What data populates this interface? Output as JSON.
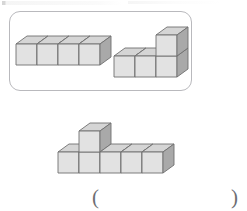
{
  "page": {
    "background_color": "#ffffff",
    "artifact_note": "faint cut-off ruled marks along the top edge"
  },
  "figure_panel": {
    "border_color": "#b9b9bd",
    "corner_radius": 11,
    "label": "reference solids panel"
  },
  "cube_style": {
    "top_face_color": "#d5d5d5",
    "left_face_color": "#e2e2e2",
    "right_face_color": "#a9a9a9",
    "edge_color": "#6f6f6f",
    "cell": 21,
    "depth_x": 11,
    "depth_y": 8
  },
  "solids": [
    {
      "id": "stack-a",
      "name": "four-cube-row",
      "cube_count": 4,
      "description": "a straight row of four cubes",
      "cells": [
        {
          "x": 0,
          "y": 0,
          "z": 0
        },
        {
          "x": 1,
          "y": 0,
          "z": 0
        },
        {
          "x": 2,
          "y": 0,
          "z": 0
        },
        {
          "x": 3,
          "y": 0,
          "z": 0
        }
      ]
    },
    {
      "id": "stack-b",
      "name": "l-shaped-four-cube-solid",
      "cube_count": 4,
      "description": "a row of three cubes with one cube stacked on the right end",
      "cells": [
        {
          "x": 0,
          "y": 0,
          "z": 0
        },
        {
          "x": 1,
          "y": 0,
          "z": 0
        },
        {
          "x": 2,
          "y": 0,
          "z": 0
        },
        {
          "x": 2,
          "y": 0,
          "z": 1
        }
      ]
    },
    {
      "id": "stack-c",
      "name": "six-cube-solid-with-one-on-top",
      "cube_count": 6,
      "description": "a row of five cubes with one cube stacked on the second cube from the left",
      "cells": [
        {
          "x": 0,
          "y": 0,
          "z": 0
        },
        {
          "x": 1,
          "y": 0,
          "z": 0
        },
        {
          "x": 2,
          "y": 0,
          "z": 0
        },
        {
          "x": 3,
          "y": 0,
          "z": 0
        },
        {
          "x": 4,
          "y": 0,
          "z": 0
        },
        {
          "x": 1,
          "y": 0,
          "z": 1
        }
      ]
    }
  ],
  "answer": {
    "paren_open": "(",
    "paren_close": ")",
    "value": "",
    "placeholder": ""
  }
}
